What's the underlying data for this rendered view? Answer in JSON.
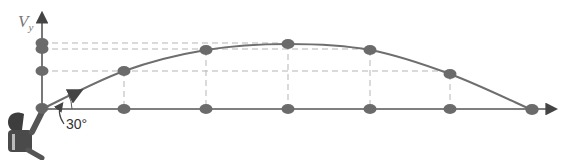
{
  "figure": {
    "type": "projectile-motion-diagram",
    "axis_label_symbol": "V",
    "axis_label_subscript": "y",
    "launch_angle_label": "30°",
    "colors": {
      "axis": "#555555",
      "trajectory": "#6e6e6e",
      "dots": "#6b6b6b",
      "dashed_guides": "#b5b5b5",
      "background": "#ffffff"
    }
  },
  "layout": {
    "origin": [
      42,
      109
    ],
    "x_axis_end": 555,
    "y_axis_top": 14,
    "trajectory_points": [
      [
        42,
        109
      ],
      [
        124,
        71
      ],
      [
        206,
        50
      ],
      [
        288,
        44
      ],
      [
        370,
        50
      ],
      [
        450,
        74
      ],
      [
        532,
        110
      ]
    ],
    "vertical_axis_dots_y": [
      43,
      49,
      71,
      108
    ],
    "horizontal_axis_dots_x": [
      124,
      206,
      288,
      370,
      450,
      532
    ]
  }
}
